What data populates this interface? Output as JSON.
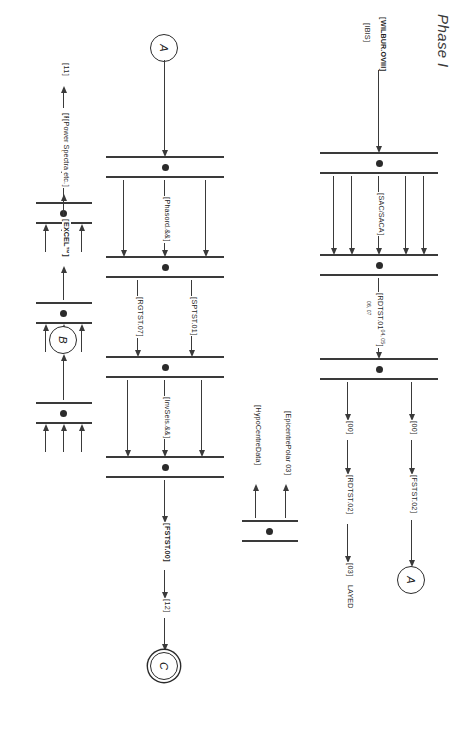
{
  "document": {
    "title": "Phase I",
    "kind": "petri-net-dataflow-diagram",
    "orientation_note": "rotated-90-degrees"
  },
  "connectors": {
    "a_top": "A",
    "b_left": "B",
    "c_bottom": "C",
    "a_lower": "A"
  },
  "labels": {
    "wilbur": "WILBUR.OVIII",
    "ibis": "IBIS",
    "sac_saca": "SAC/SACA",
    "rdtst01": "RDTST.01",
    "rdtst01_sup1": "04, 05",
    "rdtst01_sup2": "06, 07",
    "rdtst02": "RDTST.02",
    "fstst02": "FSTST.02",
    "zero_a": "00",
    "zero_b": "00",
    "zero_c": "03",
    "layed": "LAYED",
    "epicentre": "EpicentrePolar 03",
    "hypocentre": "HypoCentreData",
    "phasord": "Phasord.&&",
    "phtst00": "PHTST.00",
    "eleven": "11",
    "sptst01": "SPTST.01",
    "rgtst07": "RGTST.07",
    "excel": "EXCEL™",
    "power_spectra": "Power Spectra etc.",
    "invseis": "InvSeis.&&",
    "fstst00": "FSTST.00",
    "twelve": "12"
  },
  "colors": {
    "ink": "#2e2e2e",
    "paper": "#ffffff",
    "title": "#3a3a3a"
  }
}
